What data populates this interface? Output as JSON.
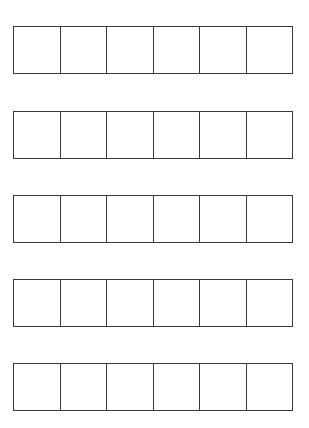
{
  "grid": {
    "rows": [
      {
        "top": 26,
        "cells": [
          "",
          "",
          "",
          "",
          "",
          ""
        ]
      },
      {
        "top": 111,
        "cells": [
          "",
          "",
          "",
          "",
          "",
          ""
        ]
      },
      {
        "top": 195,
        "cells": [
          "",
          "",
          "",
          "",
          "",
          ""
        ]
      },
      {
        "top": 279,
        "cells": [
          "",
          "",
          "",
          "",
          "",
          ""
        ]
      },
      {
        "top": 363,
        "cells": [
          "",
          "",
          "",
          "",
          "",
          ""
        ]
      }
    ],
    "columns_per_row": 6,
    "border_color": "#3a3a3a"
  }
}
